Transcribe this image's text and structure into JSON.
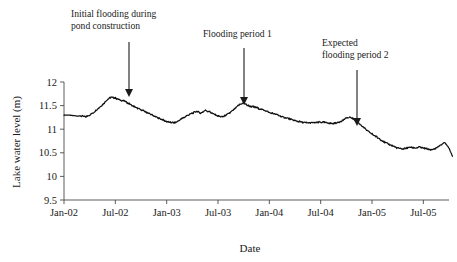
{
  "chart_data": {
    "type": "line",
    "title": "",
    "xlabel": "Date",
    "ylabel": "Lake water level (m)",
    "ylim": [
      9.5,
      12
    ],
    "yticks": [
      "9.5",
      "10",
      "10.5",
      "11",
      "11.5",
      "12"
    ],
    "ytick_values": [
      9.5,
      10,
      10.5,
      11,
      11.5,
      12
    ],
    "xticks": [
      "Jan-02",
      "Jul-02",
      "Jan-03",
      "Jul-03",
      "Jan-04",
      "Jul-04",
      "Jan-05",
      "Jul-05"
    ],
    "xtick_values": [
      0,
      6,
      12,
      18,
      24,
      30,
      36,
      42
    ],
    "xlim": [
      0,
      45
    ],
    "grid": false,
    "legend": "none",
    "series": [
      {
        "name": "Lake water level",
        "units": "m",
        "x": [
          0,
          0.5,
          1,
          1.5,
          2,
          2.5,
          3,
          3.5,
          4,
          4.5,
          5,
          5.5,
          6,
          6.5,
          7,
          7.5,
          8,
          8.5,
          9,
          9.5,
          10,
          10.5,
          11,
          11.5,
          12,
          12.5,
          13,
          13.5,
          14,
          14.5,
          15,
          15.5,
          16,
          16.5,
          17,
          17.5,
          18,
          18.5,
          19,
          19.5,
          20,
          20.5,
          21,
          21.5,
          22,
          22.5,
          23,
          23.5,
          24,
          24.5,
          25,
          25.5,
          26,
          26.5,
          27,
          27.5,
          28,
          28.5,
          29,
          29.5,
          30,
          30.5,
          31,
          31.5,
          32,
          32.5,
          33,
          33.5,
          34,
          34.5,
          35,
          35.5,
          36,
          36.5,
          37,
          37.5,
          38,
          38.5,
          39,
          39.5,
          40,
          40.5,
          41,
          41.5,
          42,
          42.5,
          43,
          43.5,
          44,
          44.5
        ],
        "values": [
          11.3,
          11.3,
          11.29,
          11.28,
          11.28,
          11.26,
          11.3,
          11.36,
          11.44,
          11.52,
          11.62,
          11.68,
          11.66,
          11.62,
          11.6,
          11.55,
          11.5,
          11.45,
          11.41,
          11.37,
          11.33,
          11.28,
          11.24,
          11.2,
          11.16,
          11.14,
          11.14,
          11.19,
          11.25,
          11.3,
          11.34,
          11.38,
          11.34,
          11.4,
          11.37,
          11.32,
          11.28,
          11.26,
          11.3,
          11.36,
          11.44,
          11.52,
          11.56,
          11.5,
          11.48,
          11.46,
          11.42,
          11.4,
          11.35,
          11.33,
          11.3,
          11.26,
          11.24,
          11.21,
          11.18,
          11.16,
          11.14,
          11.13,
          11.14,
          11.14,
          11.15,
          11.14,
          11.13,
          11.12,
          11.14,
          11.18,
          11.24,
          11.25,
          11.2,
          11.12,
          11.04,
          10.96,
          10.9,
          10.84,
          10.78,
          10.72,
          10.68,
          10.64,
          10.6,
          10.58,
          10.6,
          10.62,
          10.6,
          10.62,
          10.6,
          10.58,
          10.56,
          10.6,
          10.66,
          10.72
        ],
        "line_color": "#111111",
        "noise_amplitude": 0.02,
        "description": "Daily lake water level declining from ~11.3 m in Jan-02 to ~10.43 m by late 2005, with an early peak of ~11.68 m in mid-2002, secondary peaks ~11.4 m in early 2003 and ~11.56 m around Jul-03, and a minor rebound to ~11.25 m in mid-2004."
      }
    ],
    "series_tail": {
      "x": [
        44.5,
        45,
        45.4
      ],
      "values": [
        10.72,
        10.6,
        10.43
      ]
    },
    "annotations": [
      {
        "id": "annotation-initial-flooding",
        "lines": [
          "Initial flooding during",
          "pond construction"
        ],
        "text_x": 71,
        "text_y": 17,
        "arrow_x": 129,
        "arrow_top_y": 42,
        "arrow_tip_y": 97
      },
      {
        "id": "annotation-flooding-period-1",
        "lines": [
          "Flooding period 1"
        ],
        "text_x": 203,
        "text_y": 37,
        "arrow_x": 244,
        "arrow_top_y": 48,
        "arrow_tip_y": 105
      },
      {
        "id": "annotation-expected-flooding-period-2",
        "lines": [
          "Expected",
          "flooding period 2"
        ],
        "text_x": 322,
        "text_y": 46,
        "arrow_x": 357,
        "arrow_top_y": 70,
        "arrow_tip_y": 126
      }
    ],
    "colors": {
      "line": "#111111",
      "axis": "#4a4a4a",
      "text": "#1a1a1a",
      "background": "#ffffff"
    }
  }
}
